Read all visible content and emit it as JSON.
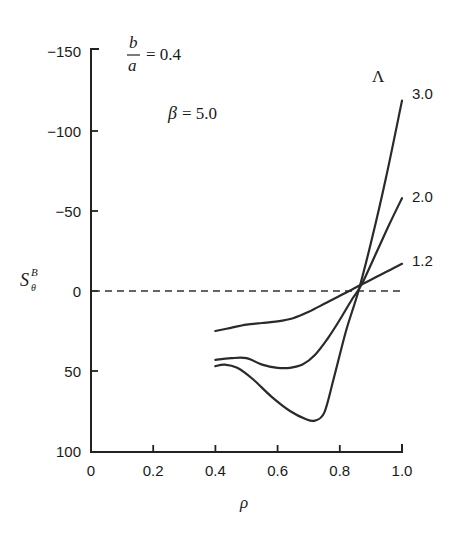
{
  "chart_data": {
    "type": "line",
    "title": "",
    "xlabel": "ρ",
    "ylabel": "S_θ^B",
    "xlim": [
      0,
      1.0
    ],
    "ylim": [
      100,
      -150
    ],
    "y_inverted": true,
    "grid": false,
    "x_ticks": [
      0,
      0.2,
      0.4,
      0.6,
      0.8,
      1.0
    ],
    "x_tick_labels": [
      "0",
      "0.2",
      "0.4",
      "0.6",
      "0.8",
      "1.0"
    ],
    "y_ticks": [
      -150,
      -100,
      -50,
      0,
      50,
      100
    ],
    "y_tick_labels": [
      "-150",
      "-100",
      "-50",
      "0",
      "50",
      "100"
    ],
    "reference_line": {
      "y": 0,
      "style": "dashed",
      "x_range": [
        0,
        1.0
      ]
    },
    "annotations": [
      {
        "text": "b/a = 0.4",
        "numerator": "b",
        "denominator": "a",
        "value": "= 0.4"
      },
      {
        "text": "β = 5.0",
        "symbol": "β",
        "value": "= 5.0"
      },
      {
        "text": "Λ",
        "role": "legend-header"
      }
    ],
    "legend_title": "Λ",
    "legend_position": "inline-right",
    "series": [
      {
        "name": "3.0",
        "x": [
          0.4,
          0.43,
          0.47,
          0.52,
          0.58,
          0.64,
          0.69,
          0.72,
          0.75,
          0.78,
          0.82,
          0.86,
          0.9,
          0.95,
          1.0
        ],
        "y": [
          47,
          46,
          48,
          55,
          66,
          75,
          80,
          81,
          76,
          55,
          25,
          0,
          -30,
          -72,
          -119
        ]
      },
      {
        "name": "2.0",
        "x": [
          0.4,
          0.45,
          0.5,
          0.55,
          0.6,
          0.64,
          0.68,
          0.72,
          0.76,
          0.8,
          0.84,
          0.87,
          0.92,
          0.96,
          1.0
        ],
        "y": [
          43,
          42,
          42,
          46,
          48,
          48,
          46,
          40,
          30,
          18,
          5,
          -4,
          -25,
          -42,
          -58
        ]
      },
      {
        "name": "1.2",
        "x": [
          0.4,
          0.45,
          0.5,
          0.55,
          0.6,
          0.65,
          0.7,
          0.75,
          0.8,
          0.84,
          0.87,
          0.92,
          0.96,
          1.0
        ],
        "y": [
          25,
          23,
          21,
          20,
          19,
          17,
          13,
          8,
          3,
          -1,
          -4,
          -9,
          -13,
          -17
        ]
      }
    ]
  }
}
